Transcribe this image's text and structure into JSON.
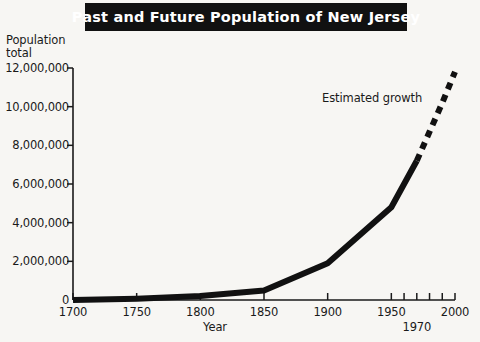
{
  "title": {
    "text": "Past and Future Population of New Jersey"
  },
  "colors": {
    "background": "#f7f6f3",
    "banner": "#111111",
    "banner_text": "#ffffff",
    "ink": "#1a1a1a",
    "series": "#111111"
  },
  "annotation": {
    "estimated_growth": "Estimated growth"
  },
  "axis": {
    "ylabel_line1": "Population",
    "ylabel_line2": "total",
    "ylabel": "Population\ntotal",
    "xlabel": "Year"
  },
  "chart_data": {
    "type": "line",
    "title": "Past and Future Population of New Jersey",
    "xlabel": "Year",
    "ylabel": "Population total",
    "xlim": [
      1700,
      2000
    ],
    "ylim": [
      0,
      12000000
    ],
    "grid": false,
    "legend": "none",
    "xticks": [
      1700,
      1750,
      1800,
      1850,
      1900,
      1950,
      1970,
      2000
    ],
    "xtick_labels": [
      "1700",
      "1750",
      "1800",
      "1850",
      "1900",
      "1950",
      "1970",
      "2000"
    ],
    "xminor_ticks": [
      1960,
      1980,
      1990
    ],
    "yticks": [
      0,
      2000000,
      4000000,
      6000000,
      8000000,
      10000000,
      12000000
    ],
    "ytick_labels": [
      "0",
      "2,000,000",
      "4,000,000",
      "6,000,000",
      "8,000,000",
      "10,000,000",
      "12,000,000"
    ],
    "series": [
      {
        "name": "Recorded population",
        "style": "solid",
        "x": [
          1700,
          1750,
          1800,
          1850,
          1900,
          1950,
          1970
        ],
        "values": [
          0,
          70000,
          210000,
          490000,
          1900000,
          4800000,
          7200000
        ]
      },
      {
        "name": "Estimated growth",
        "style": "dashed",
        "x": [
          1970,
          1980,
          1990,
          2000
        ],
        "values": [
          7200000,
          8700000,
          10200000,
          11800000
        ]
      }
    ],
    "annotations": [
      {
        "text": "Estimated growth",
        "x": 1930,
        "y": 9800000
      }
    ]
  }
}
